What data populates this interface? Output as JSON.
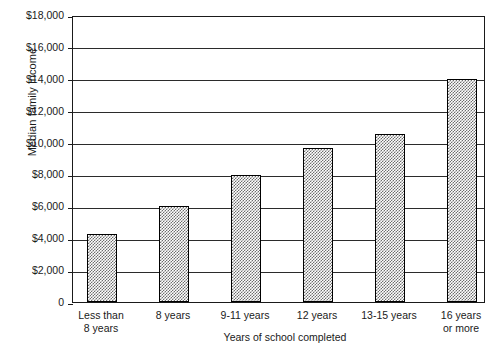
{
  "chart_data": {
    "type": "bar",
    "title": "",
    "xlabel": "Years of school completed",
    "ylabel": "Median family income",
    "categories": [
      "Less than\n8 years",
      "8 years",
      "9-11 years",
      "12 years",
      "13-15 years",
      "16 years\nor more"
    ],
    "category_lines": [
      [
        "Less than",
        "8 years"
      ],
      [
        "8 years",
        ""
      ],
      [
        "9-11 years",
        ""
      ],
      [
        "12 years",
        ""
      ],
      [
        "13-15 years",
        ""
      ],
      [
        "16 years",
        "or more"
      ]
    ],
    "values": [
      4250,
      6000,
      7950,
      9650,
      10550,
      14000
    ],
    "ylim": [
      0,
      18000
    ],
    "ytick_values": [
      0,
      2000,
      4000,
      6000,
      8000,
      10000,
      12000,
      14000,
      16000,
      18000
    ],
    "ytick_labels": [
      "0",
      "$2,000",
      "$4,000",
      "$6,000",
      "$8,000",
      "$10,000",
      "$12,000",
      "$14,000",
      "$16,000",
      "$18,000"
    ],
    "grid": true,
    "legend": null,
    "bar_fill": "checkerboard-dither-gray",
    "bar_outline_color": "#000000",
    "axis_color": "#1a1a1a",
    "background_color": "#ffffff"
  }
}
